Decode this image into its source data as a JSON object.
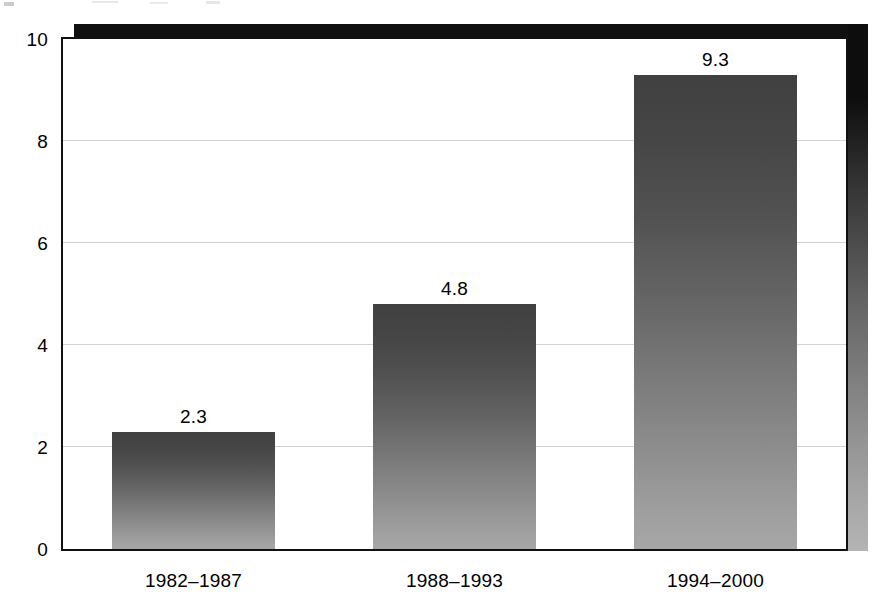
{
  "chart_data": {
    "type": "bar",
    "title": "",
    "subtitle": "",
    "xlabel": "",
    "ylabel": "",
    "categories": [
      "1982–1987",
      "1988–1993",
      "1994–2000"
    ],
    "values": [
      2.3,
      4.8,
      9.3
    ],
    "data_labels": [
      "2.3",
      "4.8",
      "9.3"
    ],
    "ylim": [
      0,
      10
    ],
    "y_ticks": [
      0,
      2,
      4,
      6,
      8,
      10
    ],
    "y_tick_labels": [
      "0",
      "2",
      "4",
      "6",
      "8",
      "10"
    ],
    "gridlines": {
      "horizontal": true,
      "vertical": false,
      "values": [
        2,
        4,
        6,
        8
      ],
      "color": "#d2d2d2"
    },
    "legend": {
      "visible": false,
      "entries": []
    },
    "annotations": [],
    "style": {
      "bar_fill_top": "#404040",
      "bar_fill_bottom": "#a6a6a6",
      "bar_gradient": "vertical dark-to-light",
      "plot_background": "#ffffff",
      "frame_color": "#111111",
      "shadow_color": "#0d0d0d",
      "label_color": "#000000"
    }
  }
}
